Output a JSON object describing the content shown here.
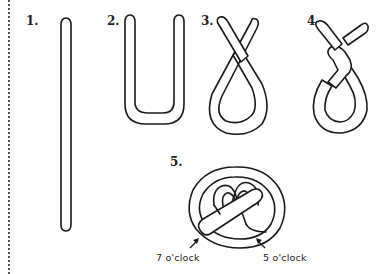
{
  "steps": [
    {
      "label": "1.",
      "description": "straight rope of dough"
    },
    {
      "label": "2.",
      "description": "U shape"
    },
    {
      "label": "3.",
      "description": "ends crossed"
    },
    {
      "label": "4.",
      "description": "ends twisted"
    },
    {
      "label": "5.",
      "description": "ends folded down onto loop"
    }
  ],
  "annotations": {
    "left": "7 o'clock",
    "right": "5 o'clock"
  },
  "colors": {
    "line": "#1a1a1a",
    "background": "#ffffff"
  }
}
